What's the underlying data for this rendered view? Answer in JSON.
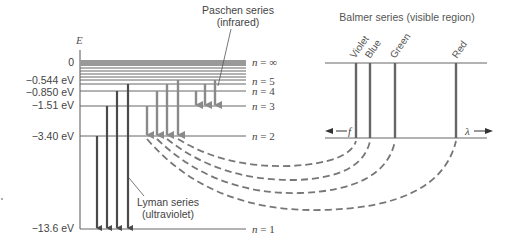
{
  "diagram": {
    "axis_label": "E",
    "energy_labels": [
      {
        "text": "0",
        "y": 62
      },
      {
        "text": "−0.544 eV",
        "y": 84
      },
      {
        "text": "−0.850 eV",
        "y": 92
      },
      {
        "text": "−1.51 eV",
        "y": 106
      },
      {
        "text": "−3.40 eV",
        "y": 136
      },
      {
        "text": "−13.6 eV",
        "y": 229
      }
    ],
    "levels": [
      {
        "label": "n = ∞",
        "n": "∞",
        "y": 62
      },
      {
        "label": "n = 5",
        "n": "5",
        "y": 82
      },
      {
        "label": "n = 4",
        "n": "4",
        "y": 91
      },
      {
        "label": "n = 3",
        "n": "3",
        "y": 106
      },
      {
        "label": "n = 2",
        "n": "2",
        "y": 136
      },
      {
        "label": "n = 1",
        "n": "1",
        "y": 229
      }
    ],
    "series": {
      "lyman": {
        "name": "Lyman series",
        "region": "(ultraviolet)"
      },
      "balmer_transitions": {
        "name": "Balmer"
      },
      "paschen": {
        "name": "Paschen series",
        "region": "(infrared)"
      }
    },
    "spectrum_panel": {
      "title": "Balmer series (visible region)",
      "lines": [
        "Violet",
        "Blue",
        "Green",
        "Red"
      ],
      "freq_label": "f",
      "wavelength_label": "λ"
    },
    "colors": {
      "line": "#555555",
      "arrow": "#4a4a4a",
      "arrow_light": "#8a8a8a",
      "text": "#444444"
    }
  }
}
